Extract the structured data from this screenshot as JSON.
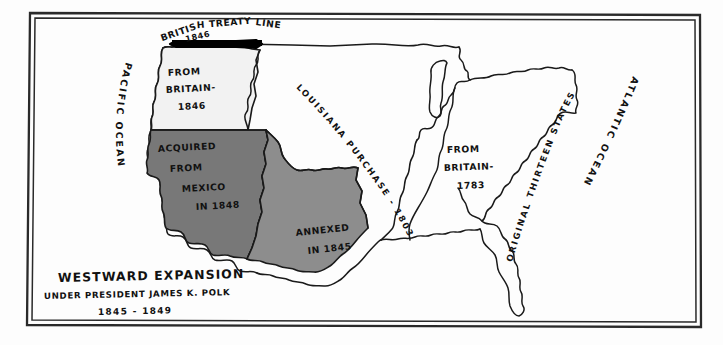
{
  "title_block": {
    "line1": "WESTWARD EXPANSION",
    "line2": "UNDER PRESIDENT JAMES K. POLK",
    "line3": "1845 - 1849"
  },
  "treaty_line": {
    "label": "BRITISH TREATY LINE",
    "year": "1846"
  },
  "oceans": {
    "pacific": "PACIFIC OCEAN",
    "atlantic": "ATLANTIC OCEAN"
  },
  "territories": [
    {
      "id": "oregon",
      "name": "Oregon Country",
      "label_lines": [
        "FROM",
        "BRITAIN-",
        "1846"
      ],
      "fill": "#f2f2f2",
      "acquisition": "From Britain",
      "year": "1846"
    },
    {
      "id": "mexican-cession",
      "name": "Mexican Cession",
      "label_lines": [
        "ACQUIRED",
        "FROM",
        "MEXICO",
        "IN 1848"
      ],
      "fill": "#787878",
      "acquisition": "Acquired from Mexico",
      "year": "1848"
    },
    {
      "id": "texas-annexation",
      "name": "Texas Annexation",
      "label_lines": [
        "ANNEXED",
        "IN 1845"
      ],
      "fill": "#8d8d8d",
      "acquisition": "Annexed",
      "year": "1845"
    },
    {
      "id": "louisiana-purchase",
      "name": "Louisiana Purchase",
      "label_lines": [
        "LOUISIANA PURCHASE - 1803"
      ],
      "fill": "#ffffff",
      "acquisition": "Louisiana Purchase",
      "year": "1803"
    },
    {
      "id": "from-britain-1783",
      "name": "From Britain 1783",
      "label_lines": [
        "FROM",
        "BRITAIN-",
        "1783"
      ],
      "fill": "#ffffff",
      "acquisition": "From Britain",
      "year": "1783"
    },
    {
      "id": "original-thirteen",
      "name": "Original Thirteen States",
      "label_lines": [
        "ORIGINAL THIRTEEN STATES"
      ],
      "fill": "#ffffff",
      "acquisition": "Original colonies",
      "year": ""
    }
  ],
  "colors": {
    "ink": "#1a1a1a",
    "paper": "#fdfdfd",
    "mexico_gray": "#787878",
    "texas_gray": "#8d8d8d",
    "oregon_gray": "#f2f2f2",
    "treaty_bar": "#000000"
  }
}
